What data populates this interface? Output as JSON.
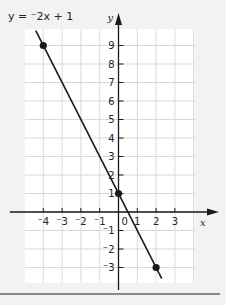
{
  "chart_data": {
    "type": "line",
    "title": "y = ⁻2x + 1",
    "equation": {
      "slope": -2,
      "intercept": 1
    },
    "xlabel": "x",
    "ylabel": "y",
    "xlim": [
      -5,
      4
    ],
    "ylim": [
      -4,
      10
    ],
    "grid": true,
    "x_ticks": [
      -4,
      -3,
      -2,
      -1,
      1,
      2,
      3
    ],
    "x_tick_labels": [
      "⁻4",
      "⁻3",
      "⁻2",
      "⁻1",
      "1",
      "2",
      "3"
    ],
    "y_ticks": [
      9,
      8,
      7,
      6,
      5,
      4,
      3,
      2,
      1,
      -1,
      -2,
      -3
    ],
    "y_tick_labels": [
      "9",
      "8",
      "7",
      "6",
      "5",
      "4",
      "3",
      "2",
      "1",
      "⁻1",
      "⁻2",
      "⁻3"
    ],
    "origin_label": "0",
    "line_extent": {
      "x": [
        -4.4,
        2.3
      ]
    },
    "points": [
      {
        "x": -4,
        "y": 9
      },
      {
        "x": 0,
        "y": 1
      },
      {
        "x": 2,
        "y": -3
      }
    ],
    "colors": {
      "line": "#1a1a1a",
      "grid": "#d9d9d9",
      "axis": "#1a1a1a",
      "plot_bg": "#ffffff"
    }
  }
}
